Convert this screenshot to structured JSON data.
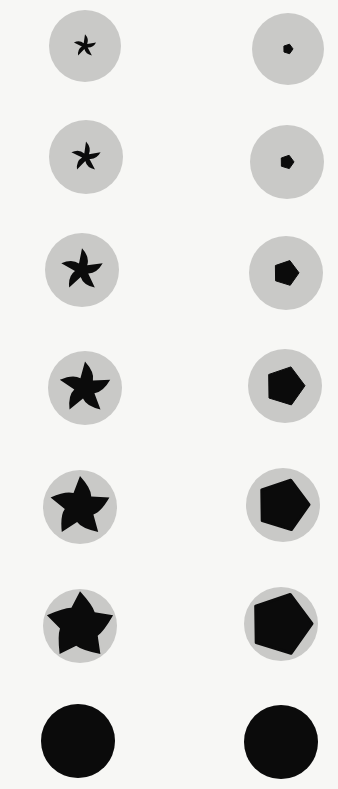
{
  "plate": {
    "background": "#f7f7f5",
    "disc_color": "#c9c9c7",
    "opening_color": "#0b0b0b",
    "description": "Two columns of iris diaphragm discs showing progressive aperture opening"
  },
  "left_column": {
    "type": "curved-blade iris (5 blades)",
    "items": [
      {
        "cx": 85,
        "cy": 46,
        "r": 36,
        "opening": 0.1
      },
      {
        "cx": 86,
        "cy": 157,
        "r": 37,
        "opening": 0.22
      },
      {
        "cx": 82,
        "cy": 270,
        "r": 37,
        "opening": 0.45
      },
      {
        "cx": 85,
        "cy": 388,
        "r": 37,
        "opening": 0.62
      },
      {
        "cx": 80,
        "cy": 507,
        "r": 37,
        "opening": 0.78
      },
      {
        "cx": 80,
        "cy": 626,
        "r": 37,
        "opening": 0.92
      },
      {
        "cx": 78,
        "cy": 741,
        "r": 37,
        "opening": 1.0
      }
    ]
  },
  "right_column": {
    "type": "pentagonal iris",
    "items": [
      {
        "cx": 288,
        "cy": 49,
        "r": 36,
        "hole": 5
      },
      {
        "cx": 287,
        "cy": 162,
        "r": 37,
        "hole": 7
      },
      {
        "cx": 286,
        "cy": 273,
        "r": 37,
        "hole": 13
      },
      {
        "cx": 285,
        "cy": 386,
        "r": 37,
        "hole": 20
      },
      {
        "cx": 283,
        "cy": 505,
        "r": 37,
        "hole": 26
      },
      {
        "cx": 281,
        "cy": 624,
        "r": 37,
        "hole": 31
      },
      {
        "cx": 281,
        "cy": 742,
        "r": 37,
        "hole": 37
      }
    ]
  }
}
